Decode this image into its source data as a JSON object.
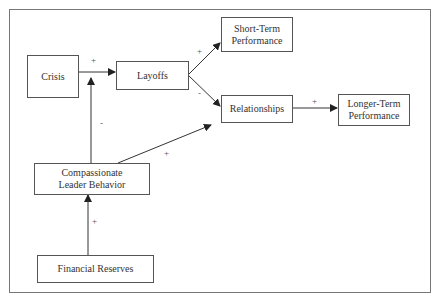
{
  "nodes": {
    "crisis": "Crisis",
    "layoffs": "Layoffs",
    "short_term": "Short-Term Performance",
    "relationships": "Relationships",
    "longer_term": "Longer-Term Performance",
    "compassionate": "Compassionate Leader Behavior",
    "financial": "Financial Reserves"
  },
  "edges": [
    {
      "from": "Crisis",
      "to": "Layoffs",
      "sign": "+"
    },
    {
      "from": "Layoffs",
      "to": "Short-Term Performance",
      "sign": "+"
    },
    {
      "from": "Layoffs",
      "to": "Relationships",
      "sign": "-"
    },
    {
      "from": "Relationships",
      "to": "Longer-Term Performance",
      "sign": "+"
    },
    {
      "from": "Compassionate Leader Behavior",
      "to": "Layoffs",
      "sign": "-"
    },
    {
      "from": "Compassionate Leader Behavior",
      "to": "Relationships",
      "sign": "+"
    },
    {
      "from": "Financial Reserves",
      "to": "Compassionate Leader Behavior",
      "sign": "+"
    }
  ],
  "signs": {
    "crisis_layoffs": "+",
    "layoffs_short": "+",
    "layoffs_rel": "-",
    "rel_longer": "+",
    "comp_layoffs": "-",
    "comp_rel": "+",
    "fin_comp": "+"
  }
}
